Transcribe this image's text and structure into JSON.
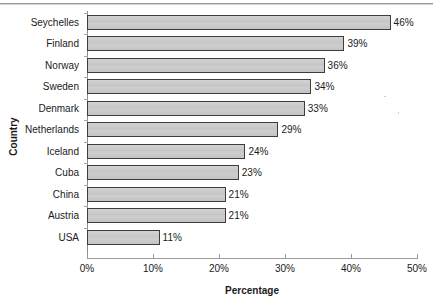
{
  "chart_data": {
    "type": "bar",
    "orientation": "horizontal",
    "title": "",
    "xlabel": "Percentage",
    "ylabel": "Country",
    "categories": [
      "Seychelles",
      "Finland",
      "Norway",
      "Sweden",
      "Denmark",
      "Netherlands",
      "Iceland",
      "Cuba",
      "China",
      "Austria",
      "USA"
    ],
    "values": [
      46,
      39,
      36,
      34,
      33,
      29,
      24,
      23,
      21,
      21,
      11
    ],
    "value_labels": [
      "46%",
      "39%",
      "36%",
      "34%",
      "33%",
      "29%",
      "24%",
      "23%",
      "21%",
      "21%",
      "11%"
    ],
    "xlim": [
      0,
      50
    ],
    "xticks": [
      0,
      10,
      20,
      30,
      40,
      50
    ],
    "xtick_labels": [
      "0%",
      "10%",
      "20%",
      "30%",
      "40%",
      "50%"
    ],
    "grid": false,
    "legend": null,
    "bar_fill_color": "#c9c9c9",
    "bar_border_color": "#3d3d3d",
    "axis_color": "#9a9a9a",
    "text_color": "#1a1a1a"
  }
}
